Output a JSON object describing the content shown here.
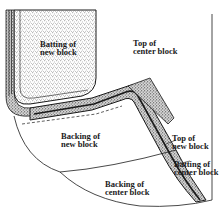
{
  "diagram": {
    "type": "quilting-layers-illustration",
    "colors": {
      "ink": "#1a1a1a",
      "background": "#ffffff",
      "batting_stipple": "#7a7a7a"
    },
    "labels": {
      "batting_new_block": "Batting of\nnew block",
      "top_center_block": "Top of\ncenter block",
      "backing_new_block": "Backing of\nnew block",
      "top_new_block": "Top of\nnew block",
      "batting_center_block": "Batting of\ncenter block",
      "backing_center_block": "Backing of\ncenter block"
    }
  }
}
